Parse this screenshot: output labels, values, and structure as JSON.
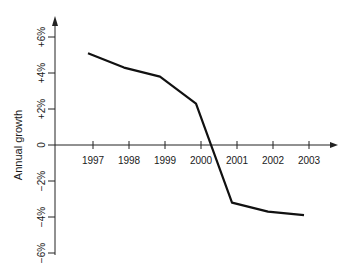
{
  "chart_data": {
    "type": "line",
    "title": "",
    "xlabel": "",
    "ylabel": "Annual growth",
    "categories": [
      "1997",
      "1998",
      "1999",
      "2000",
      "2001",
      "2002",
      "2003"
    ],
    "series": [
      {
        "name": "Annual growth",
        "values": [
          5.1,
          4.3,
          3.8,
          2.3,
          -3.2,
          -3.7,
          -3.9
        ],
        "color": "#111111"
      }
    ],
    "y_ticks": [
      6,
      4,
      2,
      0,
      -2,
      -4,
      -6
    ],
    "y_tick_labels": [
      "+6%",
      "+4%",
      "+2%",
      "0",
      "−2%",
      "−4%",
      "−6%"
    ],
    "ylim": [
      -6,
      6
    ],
    "grid": false,
    "legend": "none"
  }
}
